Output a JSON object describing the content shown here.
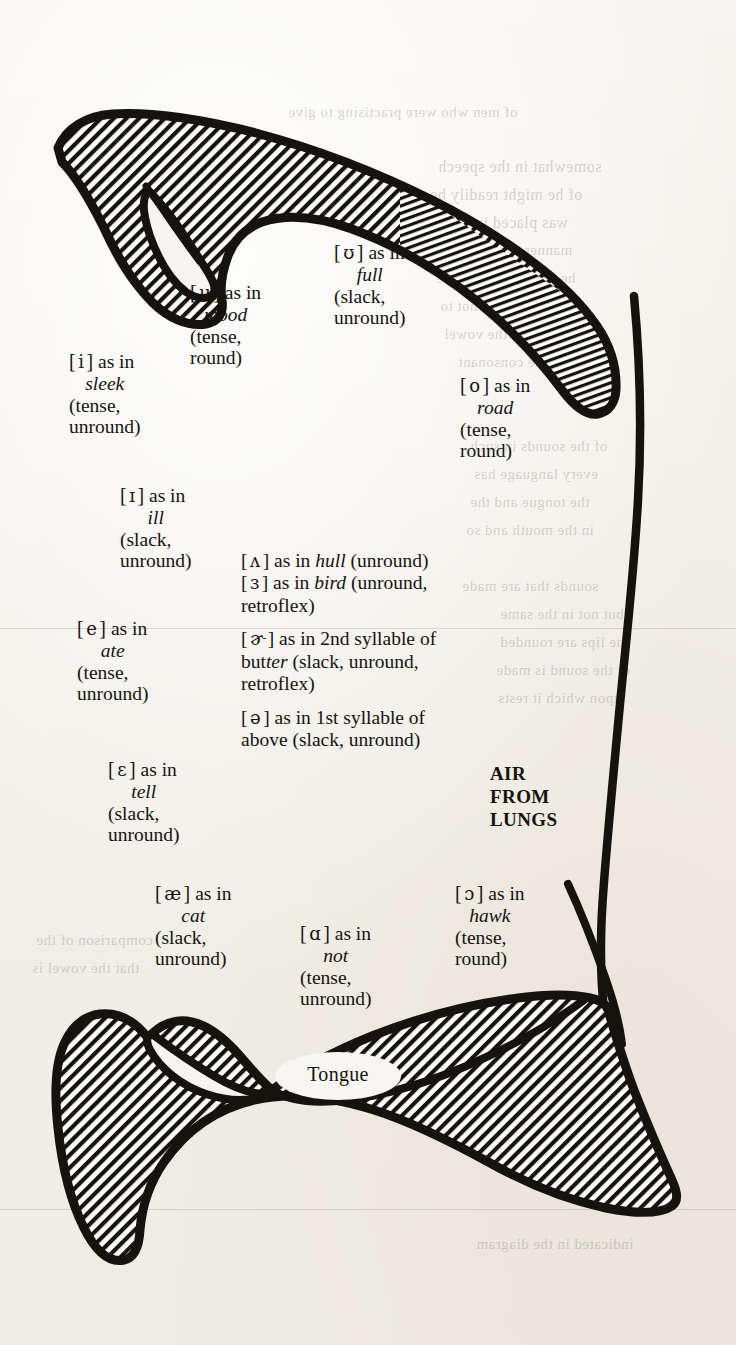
{
  "figure": {
    "tongue_label": "Tongue",
    "air_label": {
      "line1": "AIR",
      "line2": "FROM",
      "line3": "LUNGS"
    }
  },
  "vowels": {
    "i": {
      "bracket_open": "[",
      "symbol": "i",
      "bracket_close": "]",
      "as_in": "as in",
      "word": "sleek",
      "qual1": "(tense,",
      "qual2": "unround)"
    },
    "u": {
      "bracket_open": "[",
      "symbol": "u",
      "bracket_close": "]",
      "as_in": "as in",
      "word": "mood",
      "qual1": "(tense,",
      "qual2": "round)"
    },
    "upsilon": {
      "bracket_open": "[",
      "symbol": "ʊ",
      "bracket_close": "]",
      "as_in": "as in",
      "word": "full",
      "qual1": "(slack,",
      "qual2": "unround)"
    },
    "o": {
      "bracket_open": "[",
      "symbol": "o",
      "bracket_close": "]",
      "as_in": "as in",
      "word": "road",
      "qual1": "(tense,",
      "qual2": "round)"
    },
    "small_i": {
      "bracket_open": "[",
      "symbol": "ɪ",
      "bracket_close": "]",
      "as_in": "as in",
      "word": "ill",
      "qual1": "(slack,",
      "qual2": "unround)"
    },
    "e": {
      "bracket_open": "[",
      "symbol": "e",
      "bracket_close": "]",
      "as_in": "as in",
      "word": "ate",
      "qual1": "(tense,",
      "qual2": "unround)"
    },
    "epsilon": {
      "bracket_open": "[",
      "symbol": "ɛ",
      "bracket_close": "]",
      "as_in": "as in",
      "word": "tell",
      "qual1": "(slack,",
      "qual2": "unround)"
    },
    "ash": {
      "bracket_open": "[",
      "symbol": "æ",
      "bracket_close": "]",
      "as_in": "as in",
      "word": "cat",
      "qual1": "(slack,",
      "qual2": "unround)"
    },
    "script_a": {
      "bracket_open": "[",
      "symbol": "ɑ",
      "bracket_close": "]",
      "as_in": "as in",
      "word": "not",
      "qual1": "(tense,",
      "qual2": "unround)"
    },
    "open_o": {
      "bracket_open": "[",
      "symbol": "ɔ",
      "bracket_close": "]",
      "as_in": "as in",
      "word": "hawk",
      "qual1": "(tense,",
      "qual2": "round)"
    }
  },
  "central_vowels": {
    "caret": {
      "bracket_open": "[",
      "symbol": "ʌ",
      "bracket_close": "]",
      "as_in": "as in",
      "word": "hull",
      "qual": "(unround)"
    },
    "reversed_epsilon": {
      "bracket_open": "[",
      "symbol": "ɜ",
      "bracket_close": "]",
      "as_in": "as in",
      "word": "bird",
      "qual": "(unround,",
      "qual_cont": "retroflex)"
    },
    "rhotic_schwa": {
      "bracket_open": "[",
      "symbol": "ɚ",
      "bracket_close": "]",
      "as_in": "as in 2nd syllable of",
      "word_pre": "but",
      "word_italic": "ter",
      "qual": "(slack, unround,",
      "qual_cont": "retroflex)"
    },
    "schwa": {
      "bracket_open": "[",
      "symbol": "ə",
      "bracket_close": "]",
      "as_in": "as in 1st syllable of",
      "word": "above",
      "qual": "(slack, unround)"
    }
  },
  "colors": {
    "ink": "#16130f",
    "paper": "#f4f2ee",
    "bleed": "rgba(120,114,104,0.30)"
  },
  "bleed_text": {
    "t1": "of men who were practising to give",
    "t2": "somewhat in the speech",
    "t3": "of he might readily be",
    "t4": "was placed in every",
    "t5": "manner the source of",
    "t6": "he will see that in the",
    "t7": "of. It would be not to",
    "t8": "understand the vowel",
    "t9": "and the consonant",
    "t10": "of the sounds in such",
    "t11": "every language has",
    "t12": "the tongue and the",
    "t13": "in the mouth and so",
    "t14": "sounds that are made",
    "t15": "but not in the same",
    "t16": "the lips are rounded",
    "t17": "or the sound is made",
    "t18": "upon which it rests",
    "t19": "comparison of the",
    "t20": "that the vowel is",
    "t21": "considerably in the",
    "t22": "sounds in the English",
    "t23": "indicated in the diagram"
  }
}
